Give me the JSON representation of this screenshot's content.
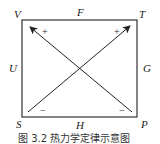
{
  "diagram": {
    "corners": {
      "top_left": "V",
      "top_right": "T",
      "bottom_left": "S",
      "bottom_right": "P"
    },
    "edges": {
      "top": "F",
      "right": "G",
      "bottom": "H",
      "left": "U"
    },
    "arrows": [
      {
        "from": "S",
        "to": "T",
        "tail_sign": "−",
        "head_sign": "+"
      },
      {
        "from": "P",
        "to": "V",
        "tail_sign": "−",
        "head_sign": "+"
      }
    ],
    "caption": "图 3.2  热力学定律示意图"
  }
}
